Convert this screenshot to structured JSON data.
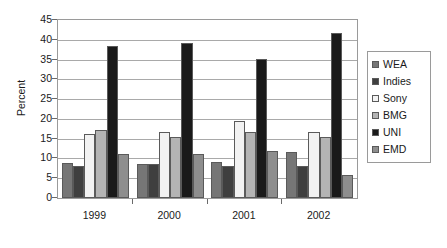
{
  "chart_data": {
    "type": "bar",
    "title": "",
    "subtitle": "",
    "xlabel": "",
    "ylabel": "Percent",
    "categories": [
      "1999",
      "2000",
      "2001",
      "2002"
    ],
    "ylim": [
      0,
      45
    ],
    "ytick_step": 5,
    "yticks": [
      0,
      5,
      10,
      15,
      20,
      25,
      30,
      35,
      40,
      45
    ],
    "ytick_labels": [
      "0",
      "5",
      "10",
      "15",
      "20",
      "25",
      "30",
      "35",
      "40",
      "45"
    ],
    "grid": "horizontal",
    "legend_position": "right",
    "series": [
      {
        "name": "WEA",
        "color": "#767676",
        "values": [
          8.9,
          8.7,
          9.1,
          11.6
        ]
      },
      {
        "name": "Indies",
        "color": "#3f3f3f",
        "values": [
          8.0,
          8.7,
          8.0,
          8.1
        ]
      },
      {
        "name": "Sony",
        "color": "#f2f2f2",
        "values": [
          16.1,
          16.8,
          19.4,
          16.6
        ]
      },
      {
        "name": "BMG",
        "color": "#b4b4b4",
        "values": [
          17.3,
          15.3,
          16.6,
          15.5
        ]
      },
      {
        "name": "UNI",
        "color": "#1a1a1a",
        "values": [
          38.5,
          39.1,
          35.1,
          41.8
        ]
      },
      {
        "name": "EMD",
        "color": "#8e8e8e",
        "values": [
          11.2,
          11.1,
          11.9,
          5.9
        ]
      }
    ]
  },
  "legend": {
    "items": [
      {
        "label": "WEA"
      },
      {
        "label": "Indies"
      },
      {
        "label": "Sony"
      },
      {
        "label": "BMG"
      },
      {
        "label": "UNI"
      },
      {
        "label": "EMD"
      }
    ]
  },
  "axis": {
    "y_title": "Percent"
  },
  "colors": {
    "plot_border": "#9a9a9a",
    "gridline": "#a9a9a9",
    "bar_outline": "#5a5a5a",
    "text": "#1a1a1a",
    "background": "#ffffff"
  }
}
